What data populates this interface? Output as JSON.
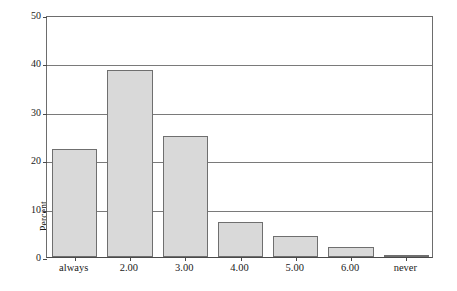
{
  "chart_data": {
    "type": "bar",
    "title": "",
    "subtitle": "",
    "xlabel": "",
    "ylabel": "Percent",
    "categories": [
      "always",
      "2.00",
      "3.00",
      "4.00",
      "5.00",
      "6.00",
      "never"
    ],
    "values": [
      22.4,
      38.7,
      24.9,
      7.2,
      4.4,
      2.1,
      0.3
    ],
    "ylim": [
      0,
      50
    ],
    "xlim_note": "categorical, 7 adjacent bars",
    "yticks": [
      0,
      10,
      20,
      30,
      40,
      50
    ],
    "ytick_labels": [
      "0",
      "10",
      "20",
      "30",
      "40",
      "50"
    ],
    "grid": "horizontal gridlines at every y tick",
    "legend": "none",
    "legend_position": "",
    "bar_fill_color": "#d9d9d9",
    "bar_border_color": "#6f6f6f",
    "grid_color": "#7a7a7a",
    "axis_color": "#4a4a4a",
    "background_color": "#ffffff",
    "annotations": []
  }
}
